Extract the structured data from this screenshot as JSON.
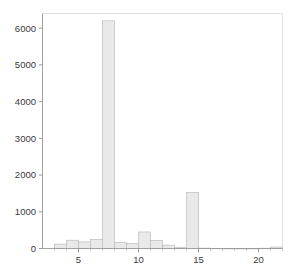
{
  "chart_data": {
    "type": "bar",
    "title": "",
    "subtitle": "",
    "xlabel": "",
    "ylabel": "",
    "legend": [],
    "grid": false,
    "xlim": [
      2,
      22
    ],
    "ylim": [
      0,
      6400
    ],
    "x_ticks": [
      5,
      10,
      15,
      20
    ],
    "x_tick_labels": [
      "5",
      "10",
      "15",
      "20"
    ],
    "x_minor_ticks": [
      3,
      4,
      6,
      7,
      8,
      9,
      11,
      12,
      13,
      14,
      16,
      17,
      18,
      19,
      21,
      22
    ],
    "y_ticks": [
      0,
      1000,
      2000,
      3000,
      4000,
      5000,
      6000
    ],
    "y_tick_labels": [
      "0",
      "1000",
      "2000",
      "3000",
      "4000",
      "5000",
      "6000"
    ],
    "bin_width": 1,
    "categories": [
      2,
      3,
      4,
      5,
      6,
      7,
      8,
      9,
      10,
      11,
      12,
      13,
      14,
      15,
      16,
      17,
      18,
      19,
      20,
      21
    ],
    "values": [
      0,
      120,
      225,
      180,
      250,
      6200,
      160,
      140,
      450,
      215,
      90,
      35,
      1530,
      10,
      5,
      3,
      2,
      2,
      8,
      40
    ],
    "series": [
      {
        "name": "counts",
        "values": [
          0,
          120,
          225,
          180,
          250,
          6200,
          160,
          140,
          450,
          215,
          90,
          35,
          1530,
          10,
          5,
          3,
          2,
          2,
          8,
          40
        ]
      }
    ],
    "colors": {
      "bar_fill": "#e9e9e9",
      "bar_stroke": "#bdbdbd",
      "axis": "#9a9a9a",
      "frame": "#e2e2e2",
      "text": "#3a3a3a",
      "background": "#ffffff"
    }
  }
}
